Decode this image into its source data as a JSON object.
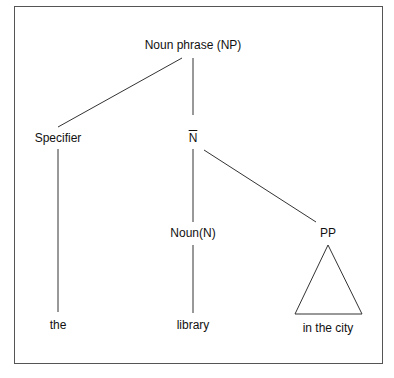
{
  "diagram": {
    "type": "syntax-tree",
    "nodes": {
      "root": "Noun phrase (NP)",
      "specifier": "Specifier",
      "nbar": "N",
      "noun": "Noun(N)",
      "pp": "PP",
      "the": "the",
      "library": "library",
      "in_the_city": "in the city"
    },
    "edges": [
      [
        "root",
        "specifier"
      ],
      [
        "root",
        "nbar"
      ],
      [
        "specifier",
        "the"
      ],
      [
        "nbar",
        "noun"
      ],
      [
        "nbar",
        "pp"
      ],
      [
        "noun",
        "library"
      ],
      [
        "pp",
        "in_the_city (triangle)"
      ]
    ]
  }
}
